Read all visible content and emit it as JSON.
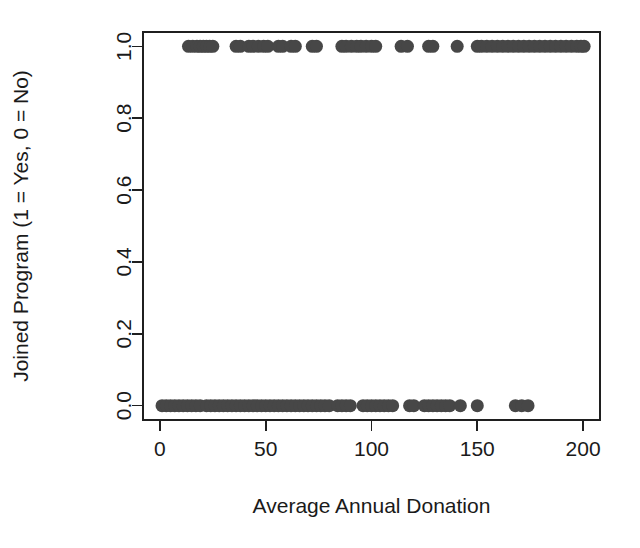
{
  "chart_data": {
    "type": "scatter",
    "title": "",
    "xlabel": "Average Annual Donation",
    "ylabel": "Joined Program (1 = Yes, 0 = No)",
    "xlim": [
      -8,
      208
    ],
    "ylim": [
      -0.04,
      1.04
    ],
    "xticks": [
      0,
      50,
      100,
      150,
      200
    ],
    "xtick_labels": [
      "0",
      "50",
      "100",
      "150",
      "200"
    ],
    "yticks": [
      0.0,
      0.2,
      0.4,
      0.6,
      0.8,
      1.0
    ],
    "ytick_labels": [
      "0.0",
      "0.2",
      "0.4",
      "0.6",
      "0.8",
      "1.0"
    ],
    "grid": false,
    "legend": "none",
    "point_color": "#474747",
    "point_radius_px": 6.5,
    "box_border": true,
    "series": [
      {
        "name": "Joined Program",
        "x": [
          13.5,
          15.5,
          17.5,
          19.0,
          20.5,
          22.0,
          23.5,
          25.0,
          36.0,
          38.0,
          42.0,
          44.0,
          46.5,
          49.0,
          51.0,
          56.0,
          58.0,
          62.0,
          64.0,
          72.0,
          74.0,
          86.0,
          88.0,
          90.5,
          93.0,
          95.0,
          97.5,
          100.0,
          102.0,
          114.0,
          117.0,
          127.0,
          129.0,
          140.5,
          150.0,
          152.0,
          154.5,
          157.0,
          159.5,
          162.0,
          164.5,
          167.0,
          169.5,
          172.0,
          174.5,
          177.0,
          179.5,
          182.0,
          184.5,
          187.0,
          189.5,
          192.0,
          194.5,
          197.0,
          199.0,
          200.5
        ],
        "y": [
          1,
          1,
          1,
          1,
          1,
          1,
          1,
          1,
          1,
          1,
          1,
          1,
          1,
          1,
          1,
          1,
          1,
          1,
          1,
          1,
          1,
          1,
          1,
          1,
          1,
          1,
          1,
          1,
          1,
          1,
          1,
          1,
          1,
          1,
          1,
          1,
          1,
          1,
          1,
          1,
          1,
          1,
          1,
          1,
          1,
          1,
          1,
          1,
          1,
          1,
          1,
          1,
          1,
          1,
          1,
          1
        ]
      },
      {
        "name": "Did Not Join",
        "x": [
          1.0,
          3.0,
          5.0,
          7.0,
          9.0,
          11.0,
          13.0,
          15.0,
          17.0,
          19.0,
          22.0,
          24.0,
          26.0,
          28.0,
          30.0,
          32.0,
          34.0,
          36.0,
          38.0,
          40.0,
          42.0,
          44.0,
          46.0,
          48.0,
          50.0,
          52.0,
          54.0,
          56.0,
          58.0,
          60.0,
          62.0,
          64.0,
          66.0,
          68.0,
          70.0,
          72.0,
          74.0,
          76.0,
          78.0,
          80.0,
          84.0,
          86.0,
          88.0,
          90.0,
          96.0,
          98.0,
          100.0,
          102.0,
          104.0,
          106.0,
          108.0,
          110.0,
          118.0,
          120.0,
          125.0,
          127.0,
          129.0,
          131.0,
          133.0,
          135.0,
          137.0,
          142.0,
          150.0,
          168.0,
          171.0,
          174.0
        ],
        "y": [
          0,
          0,
          0,
          0,
          0,
          0,
          0,
          0,
          0,
          0,
          0,
          0,
          0,
          0,
          0,
          0,
          0,
          0,
          0,
          0,
          0,
          0,
          0,
          0,
          0,
          0,
          0,
          0,
          0,
          0,
          0,
          0,
          0,
          0,
          0,
          0,
          0,
          0,
          0,
          0,
          0,
          0,
          0,
          0,
          0,
          0,
          0,
          0,
          0,
          0,
          0,
          0,
          0,
          0,
          0,
          0,
          0,
          0,
          0,
          0,
          0,
          0,
          0,
          0,
          0,
          0
        ]
      }
    ]
  }
}
